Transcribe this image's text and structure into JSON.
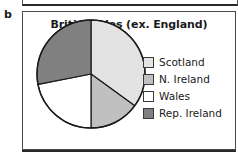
{
  "panel": {
    "letter": "b"
  },
  "chart_data": {
    "type": "pie",
    "title": "British Isles (ex. England)",
    "xlabel": "",
    "ylabel": "",
    "legend_position": "right",
    "grid": false,
    "categories": [
      "Scotland",
      "N. Ireland",
      "Wales",
      "Rep. Ireland"
    ],
    "values": [
      35,
      15,
      22,
      28
    ],
    "slices": [
      {
        "label": "Scotland",
        "value": 35,
        "color": "#e3e3e3",
        "start_angle_deg": 0,
        "end_angle_deg": 126
      },
      {
        "label": "N. Ireland",
        "value": 15,
        "color": "#c0c0c0",
        "start_angle_deg": 126,
        "end_angle_deg": 180
      },
      {
        "label": "Wales",
        "value": 22,
        "color": "#ffffff",
        "start_angle_deg": 180,
        "end_angle_deg": 259
      },
      {
        "label": "Rep. Ireland",
        "value": 28,
        "color": "#808080",
        "start_angle_deg": 259,
        "end_angle_deg": 360
      }
    ],
    "colors": {
      "scotland": "#e3e3e3",
      "n_ireland": "#c0c0c0",
      "wales": "#ffffff",
      "rep_ireland": "#808080",
      "outline": "#1a1a1a",
      "panel_border": "#4a4a4a",
      "text": "#1a1a1a"
    },
    "geometry": {
      "cx": 56,
      "cy": 56,
      "r": 54
    }
  }
}
